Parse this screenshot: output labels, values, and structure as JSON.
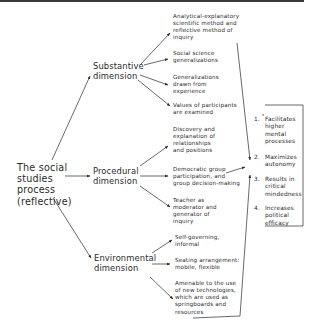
{
  "diagram": {
    "root": {
      "lines": [
        "The social",
        "studies",
        "process",
        "(reflective)"
      ]
    },
    "dimensions": [
      {
        "id": "substantive",
        "lines": [
          "Substantive",
          "dimension"
        ],
        "items": [
          {
            "lines": [
              "Analytical-explanatory",
              "scientific method and",
              "reflective method of",
              "inquiry"
            ]
          },
          {
            "lines": [
              "Social science",
              "generalizations"
            ]
          },
          {
            "lines": [
              "Generalizations",
              "drawn from",
              "experience"
            ]
          },
          {
            "lines": [
              "Values of participants",
              "are examined"
            ]
          }
        ]
      },
      {
        "id": "procedural",
        "lines": [
          "Procedural",
          "dimension"
        ],
        "items": [
          {
            "lines": [
              "Discovery and",
              "explanation of",
              "relationships",
              "and positions"
            ]
          },
          {
            "lines": [
              "Democratic group",
              "participation, and",
              "group decision-making"
            ]
          },
          {
            "lines": [
              "Teacher as",
              "moderator and",
              "generator of",
              "inquiry"
            ]
          }
        ]
      },
      {
        "id": "environmental",
        "lines": [
          "Environmental",
          "dimension"
        ],
        "items": [
          {
            "lines": [
              "Self-governing,",
              "informal"
            ]
          },
          {
            "lines": [
              "Seating arrangement:",
              "mobile, flexible"
            ]
          },
          {
            "lines": [
              "Amenable to the use",
              "of new technologies,",
              "which are used as",
              "springboards and",
              "resources"
            ]
          }
        ]
      }
    ],
    "results": [
      {
        "num": "1.",
        "lines": [
          "Facilitates",
          "higher",
          "mental",
          "processes"
        ]
      },
      {
        "num": "2.",
        "lines": [
          "Maximizes",
          "autonomy"
        ]
      },
      {
        "num": "3.",
        "lines": [
          "Results in",
          "critical",
          "mindedness"
        ]
      },
      {
        "num": "4.",
        "lines": [
          "Increases",
          "political",
          "efficacy"
        ]
      }
    ]
  },
  "colors": {
    "ink": "#2a2a2a",
    "background": "#ffffff"
  }
}
